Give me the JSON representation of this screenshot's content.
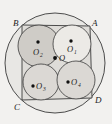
{
  "figure": {
    "caption": "Square ABCD inscribed in a large circle, containing four smaller circles O1 O2 O3 O4 meeting at center O",
    "background_color": "#f2f1ef",
    "stroke_color": "#3a3a3a",
    "outer_circle": {
      "name": "outer-circumscribed-circle",
      "cx": 55,
      "cy": 63,
      "r": 50,
      "fill": "#e8e7e4"
    },
    "square": {
      "name": "square-ABCD",
      "fill": "#dedcd8",
      "points": "22,25 90,26 92,98 22,100",
      "vertices": [
        {
          "id": "A",
          "label": "A",
          "x": 96,
          "y": 26,
          "tx": 92,
          "ty": 26
        },
        {
          "id": "B",
          "label": "B",
          "x": 22,
          "y": 25,
          "tx": 13,
          "ty": 26
        },
        {
          "id": "C",
          "label": "C",
          "x": 22,
          "y": 100,
          "tx": 14,
          "ty": 110
        },
        {
          "id": "D",
          "label": "D",
          "x": 92,
          "y": 98,
          "tx": 95,
          "ty": 103
        }
      ]
    },
    "inner_circles": [
      {
        "id": "O1",
        "label": "O",
        "subscript": "1",
        "cx": 72,
        "cy": 44,
        "r": 19,
        "fill": "#eceae6",
        "dot_x": 71,
        "dot_y": 41,
        "label_x": 67,
        "label_y": 52,
        "sub_x": 74,
        "sub_y": 54
      },
      {
        "id": "O2",
        "label": "O",
        "subscript": "2",
        "cx": 39,
        "cy": 46,
        "r": 21,
        "fill": "#cfccc7",
        "dot_x": 38,
        "dot_y": 42,
        "label_x": 33,
        "label_y": 55,
        "sub_x": 40,
        "sub_y": 57
      },
      {
        "id": "O3",
        "label": "O",
        "subscript": "3",
        "cx": 41,
        "cy": 82,
        "r": 18,
        "fill": "#dbd8d4",
        "dot_x": 33,
        "dot_y": 86,
        "label_x": 36,
        "label_y": 89,
        "sub_x": 43,
        "sub_y": 91
      },
      {
        "id": "O4",
        "label": "O",
        "subscript": "4",
        "cx": 76,
        "cy": 80,
        "r": 19,
        "fill": "#dbd8d4",
        "dot_x": 68,
        "dot_y": 82,
        "label_x": 71,
        "label_y": 85,
        "sub_x": 78,
        "sub_y": 87
      }
    ],
    "center_point": {
      "id": "O",
      "label": "O",
      "dot_x": 55,
      "dot_y": 58,
      "label_x": 59,
      "label_y": 61
    }
  }
}
